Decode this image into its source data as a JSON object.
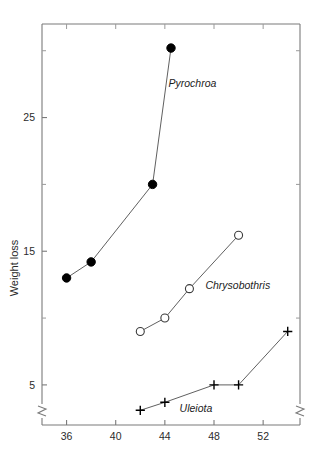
{
  "chart_data": {
    "type": "line",
    "title": "",
    "xlabel": "",
    "ylabel": "Weight loss",
    "xlim": [
      34,
      55
    ],
    "ylim": [
      2,
      32
    ],
    "grid": false,
    "legend_position": "inline-annotations",
    "axis_break": {
      "left_axis": true,
      "right_axis": true,
      "note": "zigzag break symbol near bottom of both vertical axes"
    },
    "xticks": [
      36,
      40,
      44,
      48,
      52
    ],
    "xtick_labels": [
      "36",
      "40",
      "44",
      "48",
      "52"
    ],
    "yticks": [
      5,
      15,
      25
    ],
    "ytick_labels": [
      "5",
      "15",
      "25"
    ],
    "yminorticks": [
      10,
      20,
      30
    ],
    "series": [
      {
        "name": "Pyrochroa",
        "marker": "filled-circle",
        "x": [
          36,
          38,
          43,
          44.5
        ],
        "values": [
          13.0,
          14.2,
          20.0,
          30.2
        ],
        "label": "Pyrochroa",
        "label_x": 44.3,
        "label_y": 27.3
      },
      {
        "name": "Chrysobothris",
        "marker": "open-circle",
        "x": [
          42,
          44,
          46,
          50
        ],
        "values": [
          9.0,
          10.0,
          12.2,
          16.2
        ],
        "label": "Chrysobothris",
        "label_x": 47.3,
        "label_y": 12.2
      },
      {
        "name": "Uleiota",
        "marker": "plus",
        "x": [
          42,
          44,
          48,
          50,
          54
        ],
        "values": [
          3.1,
          3.7,
          5.0,
          5.0,
          9.0
        ],
        "label": "Uleiota",
        "label_x": 45.2,
        "label_y": 3.0
      }
    ]
  }
}
